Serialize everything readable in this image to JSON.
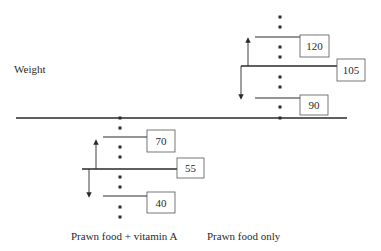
{
  "y_axis_label": "Weight",
  "baseline": {
    "x1": 16,
    "x2": 347,
    "y": 118,
    "color": "#2a2a2a"
  },
  "groups": [
    {
      "name": "prawn-food-vitamin-a",
      "label": "Prawn food + vitamin A",
      "label_pos": {
        "x": 71,
        "y": 240
      },
      "dot_x": 120,
      "dots_y": [
        118,
        128,
        147,
        157,
        177,
        187,
        207,
        217
      ],
      "mean": {
        "value": "55",
        "line": {
          "x1": 82,
          "x2": 177,
          "y": 169
        },
        "box": {
          "x": 177,
          "y": 158,
          "w": 27,
          "h": 20
        }
      },
      "upper": {
        "value": "70",
        "line": {
          "x1": 103,
          "x2": 147,
          "y": 137
        },
        "box": {
          "x": 147,
          "y": 130,
          "w": 28,
          "h": 22
        }
      },
      "lower": {
        "value": "40",
        "line": {
          "x1": 103,
          "x2": 147,
          "y": 196
        },
        "box": {
          "x": 147,
          "y": 192,
          "w": 28,
          "h": 21
        }
      },
      "arrow_up": {
        "x": 96,
        "y_from": 169,
        "y_to": 139
      },
      "arrow_down": {
        "x": 89,
        "y_from": 169,
        "y_to": 198
      }
    },
    {
      "name": "prawn-food-only",
      "label": "Prawn food only",
      "label_pos": {
        "x": 207,
        "y": 240
      },
      "dot_x": 280,
      "dots_y": [
        17,
        27,
        47,
        57,
        77,
        87,
        107,
        118
      ],
      "mean": {
        "value": "105",
        "line": {
          "x1": 241,
          "x2": 337,
          "y": 66
        },
        "box": {
          "x": 337,
          "y": 59,
          "w": 28,
          "h": 22
        }
      },
      "upper": {
        "value": "120",
        "line": {
          "x1": 255,
          "x2": 300,
          "y": 37
        },
        "box": {
          "x": 300,
          "y": 35,
          "w": 29,
          "h": 22
        }
      },
      "lower": {
        "value": "90",
        "line": {
          "x1": 255,
          "x2": 300,
          "y": 98
        },
        "box": {
          "x": 300,
          "y": 95,
          "w": 28,
          "h": 20
        }
      },
      "arrow_up": {
        "x": 248,
        "y_from": 66,
        "y_to": 37
      },
      "arrow_down": {
        "x": 241,
        "y_from": 66,
        "y_to": 100
      }
    }
  ],
  "colors": {
    "ink": "#2a2a2a",
    "box_stroke": "#555555",
    "background": "#ffffff"
  }
}
